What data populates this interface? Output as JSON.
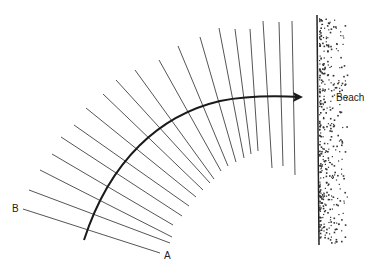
{
  "diagram": {
    "title": "",
    "labels": {
      "beach": "Beach",
      "a": "A",
      "b": "B"
    },
    "colors": {
      "crest_line": "#555555",
      "orthogonal": "#1a1a1a",
      "beach_line": "#222222",
      "sand": "#333333"
    },
    "elements": {
      "wave_crests": "Series of wave crest lines fanning around a center, becoming parallel to the beach",
      "orthogonal": "Curved arrow showing wave ray path bending toward beach",
      "beach": "Vertical shoreline with stippled sand"
    }
  }
}
